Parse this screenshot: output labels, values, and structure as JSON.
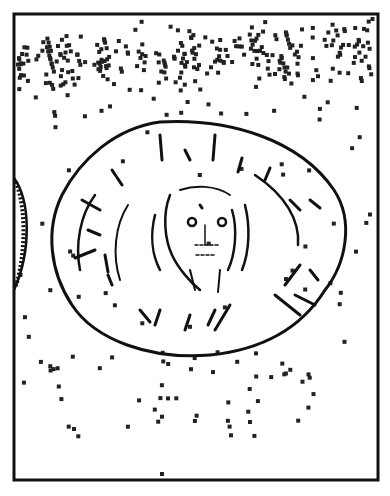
{
  "image": {
    "description": "Black-and-white line drawing of an ancient coin/medallion with a frontal face in the center, surrounded by scattered square specks, inside a rectangular frame",
    "subject": "coin-medallion",
    "ink_color": "#111111",
    "background_color": "#ffffff"
  }
}
